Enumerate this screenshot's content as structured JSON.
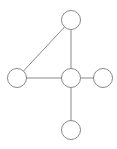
{
  "diagram": {
    "type": "graph",
    "style": {
      "stroke_color": "#8a8a8a",
      "node_fill": "#ffffff",
      "background": "#ffffff",
      "node_radius": 9.5
    },
    "nodes": [
      {
        "id": "top",
        "x": 71,
        "y": 20,
        "label": ""
      },
      {
        "id": "left",
        "x": 17,
        "y": 78,
        "label": ""
      },
      {
        "id": "center",
        "x": 71,
        "y": 78,
        "label": ""
      },
      {
        "id": "right",
        "x": 103,
        "y": 78,
        "label": ""
      },
      {
        "id": "bottom",
        "x": 71,
        "y": 130,
        "label": ""
      }
    ],
    "edges": [
      {
        "from": "top",
        "to": "left"
      },
      {
        "from": "top",
        "to": "center"
      },
      {
        "from": "left",
        "to": "center"
      },
      {
        "from": "center",
        "to": "right"
      },
      {
        "from": "center",
        "to": "bottom"
      }
    ]
  }
}
